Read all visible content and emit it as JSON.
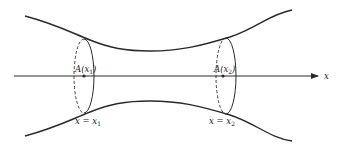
{
  "diagram": {
    "type": "solid-of-revolution-cross-sections",
    "axis": {
      "label": "x"
    },
    "cross_sections": [
      {
        "area_label": "A(x",
        "area_sub": "1",
        "area_close": ")",
        "position_label": "x = x",
        "position_sub": "1"
      },
      {
        "area_label": "A(x",
        "area_sub": "2",
        "area_close": ")",
        "position_label": "x = x",
        "position_sub": "2"
      }
    ],
    "colors": {
      "stroke": "#2a2a2a",
      "background": "#ffffff"
    }
  }
}
